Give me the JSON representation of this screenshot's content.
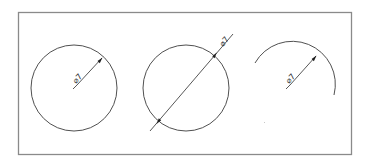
{
  "diagram": {
    "type": "cad-dimension-examples",
    "frame": {
      "x": 18,
      "y": 12,
      "width": 333,
      "height": 142,
      "stroke": "#8a8a8a"
    },
    "colors": {
      "geometry": "#3c3c3c",
      "dimension": "#2c2c2c",
      "text": "#333333",
      "background": "#ffffff"
    },
    "views": [
      {
        "name": "full-circle-radius-leader",
        "shape": "circle",
        "center": [
          74,
          88
        ],
        "radius": 43,
        "dimension_style": "leader from center to circumference, single arrow",
        "label": "⌀7"
      },
      {
        "name": "full-circle-diameter-line",
        "shape": "circle",
        "center": [
          186,
          88
        ],
        "radius": 43,
        "dimension_style": "diameter line through circle, arrows at both intersections, extended beyond",
        "label": "⌀7"
      },
      {
        "name": "arc-radius-leader",
        "shape": "arc",
        "center": [
          295,
          97
        ],
        "radius": 43,
        "dimension_style": "leader to arc, single arrow",
        "label": "⌀7"
      }
    ]
  }
}
